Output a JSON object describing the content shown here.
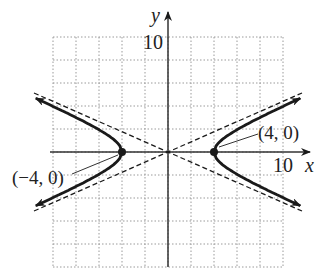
{
  "figure": {
    "title": "",
    "equation_hint": "hyperbola with vertices (-4, 0) and (4, 0)",
    "axes": {
      "x_label": "x",
      "y_label": "y",
      "x_tick_label": "10",
      "y_tick_label": "10"
    },
    "grid": {
      "xmin": -10,
      "xmax": 10,
      "ymin": -10,
      "ymax": 10,
      "step": 2
    },
    "points": [
      {
        "label": "(4, 0)",
        "x": 4,
        "y": 0
      },
      {
        "label": "(−4, 0)",
        "x": -4,
        "y": 0
      }
    ],
    "asymptote_slope": 0.433,
    "colors": {
      "curve": "#1a1a1a",
      "grid": "#9a9a9a",
      "axis": "#333333"
    }
  }
}
